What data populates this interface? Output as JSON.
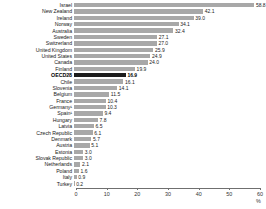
{
  "chart_data": {
    "type": "bar",
    "orientation": "horizontal",
    "title": "",
    "subtitle": "",
    "xlabel": "%",
    "ylabel": "",
    "xlim": [
      0,
      60
    ],
    "xticks": [
      0,
      10,
      20,
      30,
      40,
      50,
      60
    ],
    "xticklabels": [
      "0",
      "10",
      "20",
      "30",
      "40",
      "50",
      "60"
    ],
    "grid": false,
    "legend": null,
    "highlight_category": "OECD28",
    "colors": {
      "bar": "#a8a8a8",
      "highlight_bar": "#1c1c1c",
      "axis": "#6f6f6f",
      "text": "#1a1a1a"
    },
    "categories": [
      "Israel",
      "New Zealand",
      "Ireland",
      "Norway",
      "Australia",
      "Sweden",
      "Switzerland",
      "United Kingdom",
      "United States",
      "Canada",
      "Finland",
      "OECD28",
      "Chile",
      "Slovenia",
      "Belgium",
      "France",
      "Germany¹",
      "Spain¹",
      "Hungary",
      "Latvia",
      "Czech Republic",
      "Denmark",
      "Austria",
      "Estonia",
      "Slovak Republic",
      "Netherlands",
      "Poland",
      "Italy",
      "Turkey"
    ],
    "values": [
      58.8,
      42.1,
      39.0,
      34.1,
      32.4,
      27.1,
      27.0,
      25.9,
      24.9,
      24.0,
      19.9,
      16.9,
      16.1,
      14.1,
      11.5,
      10.4,
      10.3,
      9.4,
      7.8,
      6.5,
      6.1,
      5.7,
      5.1,
      3.0,
      3.0,
      2.1,
      1.6,
      0.9,
      0.2
    ],
    "value_labels": [
      "58.8",
      "42.1",
      "39.0",
      "34.1",
      "32.4",
      "27.1",
      "27.0",
      "25.9",
      "24.9",
      "24.0",
      "19.9",
      "16.9",
      "16.1",
      "14.1",
      "11.5",
      "10.4",
      "10.3",
      "9.4",
      "7.8",
      "6.5",
      "6.1",
      "5.7",
      "5.1",
      "3.0",
      "3.0",
      "2.1",
      "1.6",
      "0.9",
      "0.2"
    ]
  }
}
